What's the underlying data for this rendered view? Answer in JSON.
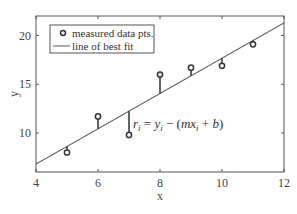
{
  "chart_data": {
    "type": "scatter",
    "title": "",
    "xlabel": "x",
    "ylabel": "y",
    "xlim": [
      4,
      12
    ],
    "ylim": [
      6,
      22
    ],
    "xticks": [
      4,
      6,
      8,
      10,
      12
    ],
    "yticks": [
      10,
      15,
      20
    ],
    "grid": false,
    "legend_position": "upper left",
    "series": [
      {
        "name": "measured data pts.",
        "kind": "scatter",
        "marker": "open-circle",
        "x": [
          5,
          6,
          7,
          8,
          9,
          10,
          11
        ],
        "y": [
          8.0,
          11.7,
          9.8,
          16.0,
          16.7,
          16.9,
          19.1
        ]
      },
      {
        "name": "line of best fit",
        "kind": "line",
        "slope": 1.81,
        "intercept": -0.43,
        "x": [
          4,
          12
        ],
        "y": [
          6.8,
          21.25
        ]
      }
    ],
    "annotations": [
      {
        "text": "r_i = y_i − (mx_i + b)",
        "x": 7.1,
        "y": 10.5
      }
    ],
    "residual_stems": true
  },
  "legend": {
    "items": [
      {
        "label": "measured data pts.",
        "icon": "open-circle-marker"
      },
      {
        "label": "line of best fit",
        "icon": "line-swatch"
      }
    ]
  },
  "annotation": {
    "r": "r",
    "i": "i",
    "eq": " = ",
    "y": "y",
    "minus": " − (",
    "mx": "mx",
    "plusb": " + ",
    "b": "b",
    "close": ")"
  },
  "colors": {
    "axis": "#555555",
    "line": "#555555",
    "marker": "#333333",
    "stem": "#222222"
  }
}
